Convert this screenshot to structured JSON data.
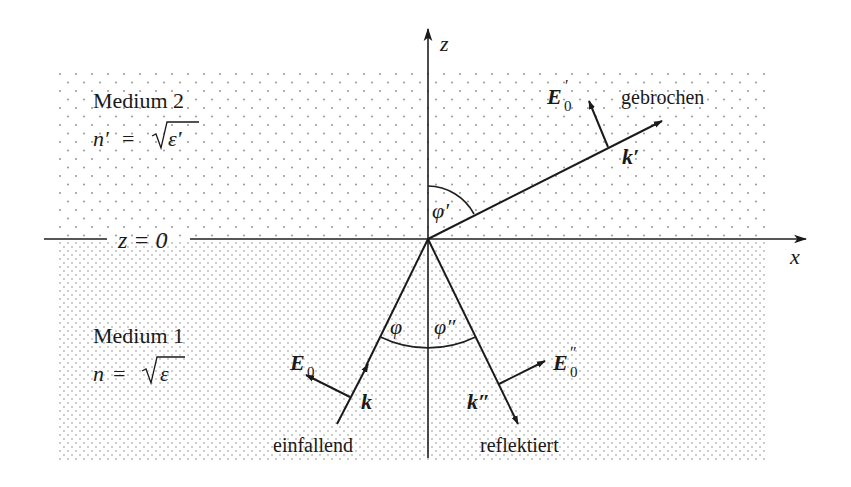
{
  "colors": {
    "line": "#1f1f1f",
    "dots": "#8a8a8a",
    "background": "#ffffff",
    "text": "#1a1a1a"
  },
  "axes": {
    "x_label": "x",
    "z_label": "z",
    "interface_label": "z = 0"
  },
  "media": {
    "upper": {
      "name": "Medium 2",
      "index_lhs": "n′",
      "eq": "=",
      "sqrt_arg": "ε′"
    },
    "lower": {
      "name": "Medium 1",
      "index_lhs": "n",
      "eq": "=",
      "sqrt_arg": "ε"
    }
  },
  "rays": {
    "incident": {
      "label": "einfallend",
      "k_label": "k",
      "e_label": "E",
      "e_sub": "0",
      "e_prime": ""
    },
    "reflected": {
      "label": "reflektiert",
      "k_label": "k″",
      "e_label": "E",
      "e_sub": "0",
      "e_prime": "″"
    },
    "refracted": {
      "label": "gebrochen",
      "k_label": "k′",
      "e_label": "E",
      "e_sub": "0",
      "e_prime": "′"
    }
  },
  "angles": {
    "incident": "φ",
    "reflected": "φ″",
    "refracted": "φ′"
  }
}
